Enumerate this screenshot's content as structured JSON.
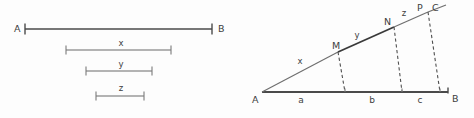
{
  "figure": {
    "background_color": "#fdfdfd",
    "ink_color": "#4a4a4a",
    "left_panel": {
      "name": "segment-comparison-panel",
      "endpoint_labels": {
        "left": "A",
        "right": "B"
      },
      "segments": [
        {
          "id": "ab",
          "label": "",
          "x1": 25,
          "x2": 212,
          "y": 29
        },
        {
          "id": "x",
          "label": "x",
          "x1": 66,
          "x2": 171,
          "y": 50
        },
        {
          "id": "y",
          "label": "y",
          "x1": 86,
          "x2": 152,
          "y": 71
        },
        {
          "id": "z",
          "label": "z",
          "x1": 96,
          "x2": 144,
          "y": 96
        }
      ],
      "label_positions": {
        "A": {
          "x": 14,
          "y": 32
        },
        "B": {
          "x": 218,
          "y": 32
        },
        "x": {
          "x": 121,
          "y": 46
        },
        "y": {
          "x": 121,
          "y": 67
        },
        "z": {
          "x": 121,
          "y": 91
        }
      }
    },
    "right_panel": {
      "name": "triangle-projection-panel",
      "vertex_labels": {
        "apex": "A",
        "base_end": "B",
        "ray_end": "C"
      },
      "ray_points": [
        {
          "label": "M",
          "x": 338,
          "y": 52
        },
        {
          "label": "N",
          "x": 394,
          "y": 27
        },
        {
          "label": "P",
          "x": 428,
          "y": 12
        }
      ],
      "ray_segment_labels": [
        {
          "label": "x",
          "x": 300,
          "y": 64
        },
        {
          "label": "y",
          "x": 357,
          "y": 38
        },
        {
          "label": "z",
          "x": 404,
          "y": 16
        }
      ],
      "base_segment_labels": [
        {
          "label": "a",
          "x": 301,
          "y": 103
        },
        {
          "label": "b",
          "x": 372,
          "y": 103
        },
        {
          "label": "c",
          "x": 420,
          "y": 103
        }
      ],
      "geometry": {
        "apex": {
          "x": 262,
          "y": 92
        },
        "base_end": {
          "x": 448,
          "y": 92
        },
        "ray_end": {
          "x": 446,
          "y": 5
        },
        "drop_feet": [
          {
            "x": 345,
            "y": 92
          },
          {
            "x": 402,
            "y": 92
          },
          {
            "x": 440,
            "y": 92
          }
        ]
      },
      "label_positions": {
        "A": {
          "x": 252,
          "y": 103
        },
        "B": {
          "x": 452,
          "y": 102
        },
        "C": {
          "x": 432,
          "y": 11
        },
        "M": {
          "x": 332,
          "y": 49
        },
        "N": {
          "x": 384,
          "y": 25
        },
        "P": {
          "x": 417,
          "y": 11
        }
      }
    }
  }
}
